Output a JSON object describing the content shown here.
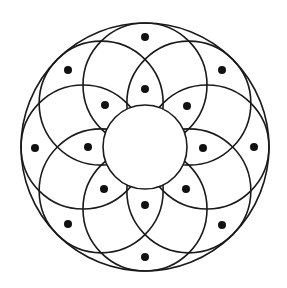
{
  "diagram": {
    "background": "#ffffff",
    "stroke_color": "#1a1a1a",
    "dot_color": "#111111",
    "center": [
      145,
      147
    ],
    "outer_circle": {
      "r": 124
    },
    "inner_circle": {
      "r": 42,
      "fill": "#ffffff"
    },
    "petal_circles": {
      "count": 8,
      "r": 62,
      "center_distance": 62,
      "angles_deg": [
        -90,
        -45,
        0,
        45,
        90,
        135,
        180,
        225
      ]
    },
    "dots": {
      "radius": 4,
      "outer_ring": [
        [
          145,
          37
        ],
        [
          222,
          70
        ],
        [
          254,
          147
        ],
        [
          222,
          225
        ],
        [
          145,
          257
        ],
        [
          68,
          224
        ],
        [
          35,
          148
        ],
        [
          68,
          70
        ]
      ],
      "inner_ring": [
        [
          145,
          89
        ],
        [
          187,
          106
        ],
        [
          203,
          148
        ],
        [
          186,
          189
        ],
        [
          145,
          205
        ],
        [
          104,
          189
        ],
        [
          88,
          147
        ],
        [
          105,
          105
        ]
      ]
    }
  }
}
